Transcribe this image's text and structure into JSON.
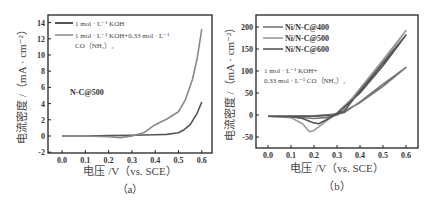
{
  "chart_data": [
    {
      "id": "a",
      "type": "line",
      "panel_label": "（a）",
      "xlabel": "电压 /V（vs. SCE）",
      "ylabel": "电流密度 /（mA · cm⁻²）",
      "xlim": [
        -0.05,
        0.65
      ],
      "ylim": [
        -2,
        15
      ],
      "xticks": [
        "0.0",
        "0.1",
        "0.2",
        "0.3",
        "0.4",
        "0.5",
        "0.6"
      ],
      "yticks": [
        "-2",
        "0",
        "2",
        "4",
        "6",
        "8",
        "10",
        "12",
        "14"
      ],
      "annotation": "N-C@500",
      "legend": [
        "1 mol · L⁻¹ KOH",
        "1 mol · L⁻¹ KOH+0.33 mol · L⁻¹",
        "CO（NH₂）₂"
      ],
      "series": [
        {
          "name": "1 mol · L⁻¹ KOH",
          "color": "#555555",
          "x": [
            0.0,
            0.1,
            0.2,
            0.3,
            0.4,
            0.45,
            0.5,
            0.52,
            0.55,
            0.58,
            0.6
          ],
          "y": [
            0.0,
            0.0,
            0.05,
            0.1,
            0.15,
            0.2,
            0.4,
            0.7,
            1.4,
            2.8,
            4.2
          ]
        },
        {
          "name": "1 mol · L⁻¹ KOH+0.33 mol · L⁻¹ CO（NH₂）₂",
          "color": "#888888",
          "x": [
            0.0,
            0.1,
            0.2,
            0.25,
            0.3,
            0.35,
            0.4,
            0.45,
            0.5,
            0.53,
            0.56,
            0.58,
            0.6
          ],
          "y": [
            0.0,
            0.0,
            -0.1,
            -0.2,
            0.0,
            0.4,
            1.4,
            2.1,
            3.0,
            4.5,
            7.0,
            9.5,
            13.2
          ]
        }
      ]
    },
    {
      "id": "b",
      "type": "line",
      "panel_label": "（b）",
      "xlabel": "电压 /V（vs. SCE）",
      "ylabel": "电流密度 /（mA · cm⁻²）",
      "xlim": [
        -0.05,
        0.65
      ],
      "ylim": [
        -70,
        210
      ],
      "xticks": [
        "0.0",
        "0.1",
        "0.2",
        "0.3",
        "0.4",
        "0.5",
        "0.6"
      ],
      "yticks": [
        "-50",
        "0",
        "50",
        "100",
        "150",
        "200"
      ],
      "annotation": [
        "1 mol · L⁻¹ KOH+",
        "0.33 mol · L⁻¹ CO（NH₂）₂"
      ],
      "legend": [
        "Ni/N-C@400",
        "Ni/N-C@500",
        "Ni/N-C@600"
      ],
      "series": [
        {
          "name": "Ni/N-C@400",
          "color": "#777777",
          "forward": {
            "x": [
              0.0,
              0.2,
              0.3,
              0.33,
              0.4,
              0.5,
              0.6
            ],
            "y": [
              -3,
              -2,
              2,
              5,
              30,
              70,
              108
            ]
          },
          "reverse": {
            "x": [
              0.6,
              0.5,
              0.4,
              0.3,
              0.25,
              0.2,
              0.1,
              0.0
            ],
            "y": [
              108,
              65,
              28,
              0,
              -6,
              -8,
              -4,
              -3
            ]
          }
        },
        {
          "name": "Ni/N-C@500",
          "color": "#999999",
          "forward": {
            "x": [
              0.0,
              0.2,
              0.28,
              0.32,
              0.4,
              0.5,
              0.6
            ],
            "y": [
              -3,
              -3,
              0,
              8,
              60,
              125,
              192
            ]
          },
          "reverse": {
            "x": [
              0.6,
              0.5,
              0.4,
              0.3,
              0.25,
              0.2,
              0.18,
              0.15,
              0.1,
              0.0
            ],
            "y": [
              192,
              120,
              55,
              5,
              -15,
              -35,
              -38,
              -20,
              -6,
              -3
            ]
          }
        },
        {
          "name": "Ni/N-C@600",
          "color": "#555555",
          "forward": {
            "x": [
              0.0,
              0.2,
              0.28,
              0.33,
              0.4,
              0.5,
              0.6
            ],
            "y": [
              -3,
              -3,
              0,
              8,
              55,
              118,
              182
            ]
          },
          "reverse": {
            "x": [
              0.6,
              0.5,
              0.4,
              0.3,
              0.25,
              0.22,
              0.2,
              0.15,
              0.1,
              0.0
            ],
            "y": [
              182,
              112,
              50,
              3,
              -12,
              -20,
              -18,
              -8,
              -4,
              -3
            ]
          }
        }
      ]
    }
  ]
}
